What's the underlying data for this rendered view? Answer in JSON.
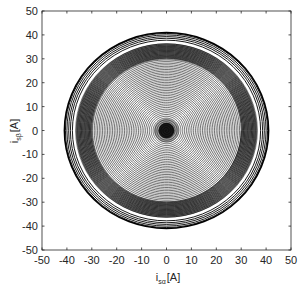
{
  "chart_data": {
    "type": "line",
    "title": "",
    "xlabel": "i_sα [A]",
    "ylabel": "i_sβ [A]",
    "xlabel_main": "i",
    "xlabel_sub": "sα",
    "xlabel_unit": "[A]",
    "ylabel_main": "i",
    "ylabel_sub": "sβ",
    "ylabel_unit": "[A]",
    "xlim": [
      -50,
      50
    ],
    "ylim": [
      -50,
      50
    ],
    "xticks": [
      -50,
      -40,
      -30,
      -20,
      -10,
      0,
      10,
      20,
      30,
      40,
      50
    ],
    "yticks": [
      -50,
      -40,
      -30,
      -20,
      -10,
      0,
      10,
      20,
      30,
      40,
      50
    ],
    "grid": false,
    "legend": null,
    "series": [
      {
        "name": "inner spiral",
        "r_start": 0,
        "r_end": 30,
        "turns": 42,
        "color": "#000000"
      },
      {
        "name": "dense band",
        "r_min": 30,
        "r_max": 36.5,
        "color": "#000000"
      },
      {
        "name": "outer rings",
        "radii": [
          37.8,
          38.6,
          39.3,
          40.0,
          40.6,
          41.0
        ],
        "color": "#000000"
      }
    ],
    "center": [
      0,
      0
    ]
  }
}
